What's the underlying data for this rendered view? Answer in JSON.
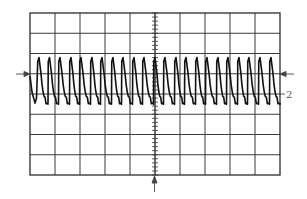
{
  "chart_data": {
    "type": "line",
    "title": "",
    "xlabel": "",
    "ylabel": "",
    "grid": true,
    "divisions": {
      "horizontal": 10,
      "vertical": 8
    },
    "screen": {
      "left": 30,
      "top": 13,
      "right": 280,
      "bottom": 175
    },
    "center_axis_minor_ticks_per_division": 5,
    "trace": {
      "description": "Periodic sawtooth-like pulse train: sharp rise to peak then exponential decay",
      "channel_label": "2",
      "baseline_div": 0.5,
      "peak_div": 1.8,
      "trough_div": -0.6,
      "period_div": 0.42,
      "cycles": 23,
      "first_peak_x_div": 0.36,
      "peak_x_div": [
        0.36,
        0.78,
        1.2,
        1.64,
        2.04,
        2.48,
        2.88,
        3.32,
        3.72,
        4.16,
        4.56,
        5.0,
        5.4,
        5.84,
        6.24,
        6.68,
        7.08,
        7.52,
        7.92,
        8.36,
        8.76,
        9.2,
        9.64
      ]
    },
    "markers": {
      "left_trigger_arrow_div": 1.0,
      "right_trigger_arrow_div": 1.0,
      "channel_2_ground_div": 0.0,
      "bottom_center_arrow": true
    },
    "colors": {
      "grid": "#3a3a3a",
      "trace": "#111111",
      "background": "#ffffff"
    }
  },
  "labels": {
    "channel_marker": "2"
  }
}
